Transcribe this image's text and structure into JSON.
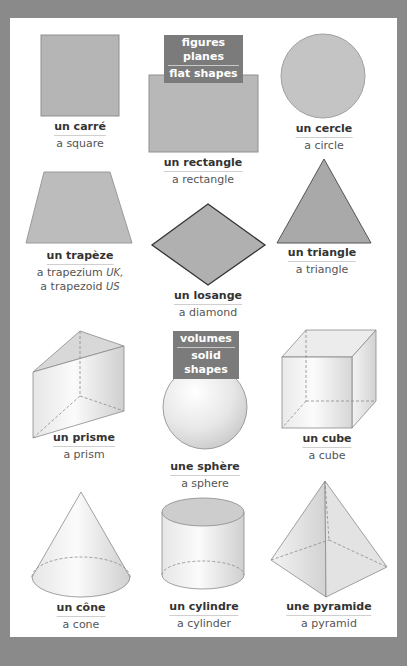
{
  "sections": {
    "flat": {
      "fr": "figures planes",
      "en": "flat shapes"
    },
    "solid": {
      "fr": "volumes",
      "en": "solid shapes"
    }
  },
  "colors": {
    "background": "#8a8a8a",
    "panel": "#ffffff",
    "flat_fill": "#b5b5b5",
    "heading_bg": "#7b7b7b"
  },
  "flat_shapes": [
    {
      "id": "square",
      "fr": "un carré",
      "en": "a square"
    },
    {
      "id": "rectangle",
      "fr": "un rectangle",
      "en": "a rectangle"
    },
    {
      "id": "circle",
      "fr": "un cercle",
      "en": "a circle"
    },
    {
      "id": "trapezium",
      "fr": "un trapèze",
      "en_line1": "a trapezium",
      "en_line1_tag": "UK,",
      "en_line2": "a trapezoid",
      "en_line2_tag": "US"
    },
    {
      "id": "diamond",
      "fr": "un losange",
      "en": "a diamond"
    },
    {
      "id": "triangle",
      "fr": "un triangle",
      "en": "a triangle"
    }
  ],
  "solid_shapes": [
    {
      "id": "prism",
      "fr": "un prisme",
      "en": "a prism"
    },
    {
      "id": "sphere",
      "fr": "une sphère",
      "en": "a sphere"
    },
    {
      "id": "cube",
      "fr": "un cube",
      "en": "a cube"
    },
    {
      "id": "cone",
      "fr": "un cône",
      "en": "a cone"
    },
    {
      "id": "cylinder",
      "fr": "un cylindre",
      "en": "a cylinder"
    },
    {
      "id": "pyramid",
      "fr": "une pyramide",
      "en": "a pyramid"
    }
  ]
}
